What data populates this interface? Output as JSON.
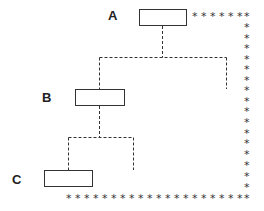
{
  "diagram": {
    "nodes": [
      {
        "id": "A",
        "label": "A"
      },
      {
        "id": "B",
        "label": "B"
      },
      {
        "id": "C",
        "label": "C"
      }
    ],
    "edges": [
      {
        "from": "A",
        "to": "B",
        "style": "dashed"
      },
      {
        "from": "A",
        "to": "unlabeled-branch",
        "style": "dashed"
      },
      {
        "from": "B",
        "to": "C",
        "style": "dashed"
      },
      {
        "from": "B",
        "to": "unlabeled-branch",
        "style": "dashed"
      },
      {
        "from": "A",
        "to": "bottom",
        "style": "asterisk-path"
      }
    ],
    "path_symbol": "*"
  }
}
